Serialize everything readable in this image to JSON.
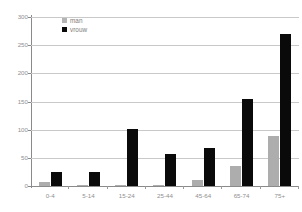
{
  "chart_data": {
    "type": "bar",
    "title": "",
    "xlabel": "",
    "ylabel": "",
    "ylim": [
      0,
      300
    ],
    "yticks": [
      0,
      50,
      100,
      150,
      200,
      250,
      300
    ],
    "grid": true,
    "legend_position": "top-left",
    "categories": [
      "0-4",
      "5-14",
      "15-24",
      "25-44",
      "45-64",
      "65-74",
      "75+"
    ],
    "series": [
      {
        "name": "man",
        "color": "#adadad",
        "values": [
          8,
          2,
          2,
          2,
          10,
          35,
          88
        ]
      },
      {
        "name": "vrouw",
        "color": "#0a0a0a",
        "values": [
          25,
          25,
          102,
          57,
          68,
          155,
          270
        ]
      }
    ]
  },
  "legend": {
    "items": [
      {
        "label": "man",
        "swatch": "man"
      },
      {
        "label": "vrouw",
        "swatch": "vrouw"
      }
    ]
  },
  "axis": {
    "y_tick_labels": [
      "300",
      "250",
      "200",
      "150",
      "100",
      "50",
      "0"
    ],
    "x_tick_labels": [
      "0-4",
      "5-14",
      "15-24",
      "25-44",
      "45-64",
      "65-74",
      "75+"
    ]
  },
  "colors": {
    "man": "#adadad",
    "vrouw": "#0a0a0a",
    "gridline": "#c9c9c9",
    "axis": "#8a8a8a",
    "tick_text": "#8f8f8f",
    "background": "#ffffff"
  }
}
